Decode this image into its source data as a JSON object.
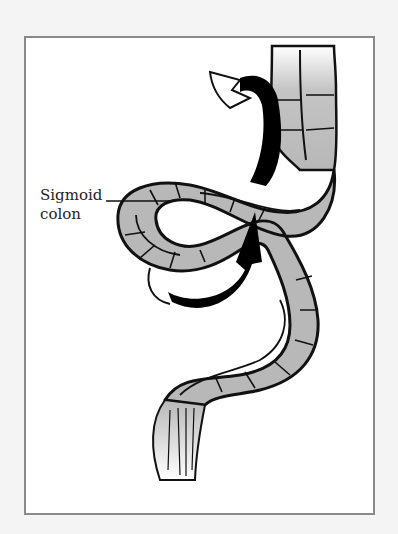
{
  "figure": {
    "label_line1": "Sigmoid",
    "label_line2": "colon",
    "colors": {
      "background": "#f4f4f4",
      "frame_fill": "#ffffff",
      "frame_border": "#8a8a8a",
      "colon_fill": "#b8b8b8",
      "outline": "#111111",
      "arrow": "#000000"
    }
  }
}
